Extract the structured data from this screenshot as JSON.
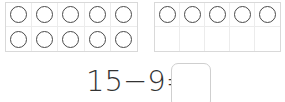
{
  "ten_frames": [
    {
      "id": "frame-a",
      "rows": 2,
      "cols": 5,
      "filled": [
        [
          true,
          true,
          true,
          true,
          true
        ],
        [
          true,
          true,
          true,
          true,
          true
        ]
      ]
    },
    {
      "id": "frame-b",
      "rows": 2,
      "cols": 5,
      "filled": [
        [
          true,
          true,
          true,
          true,
          true
        ],
        [
          false,
          false,
          false,
          false,
          false
        ]
      ]
    }
  ],
  "equation": {
    "text": "15−9=",
    "answer": ""
  },
  "colors": {
    "counter_stroke": "#4a4a4a",
    "frame_border": "#d9d9d9",
    "text": "#333333"
  }
}
